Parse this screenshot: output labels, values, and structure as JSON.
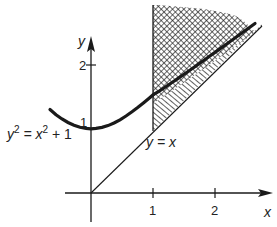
{
  "diagram": {
    "axes": {
      "x_label": "x",
      "y_label": "y",
      "x_ticks": [
        {
          "value": 1,
          "label": "1"
        },
        {
          "value": 2,
          "label": "2"
        }
      ],
      "y_ticks": [
        {
          "value": 1,
          "label": "1"
        },
        {
          "value": 2,
          "label": "2"
        }
      ]
    },
    "curves": [
      {
        "name": "hyperbola",
        "equation": "y² = x² + 1",
        "label_base": "y",
        "label_mid": " = x",
        "label_end": " + 1",
        "sup": "2"
      },
      {
        "name": "line",
        "equation": "y = x",
        "label": "y = x"
      }
    ],
    "regions": [
      {
        "name": "region-above-hyperbola",
        "bounds": "x ≥ 1, y ≥ √(x²+1)",
        "pattern": "cross-hatch"
      },
      {
        "name": "region-between",
        "bounds": "x ≥ 1, x ≤ y ≤ √(x²+1)",
        "pattern": "diagonal-hatch"
      }
    ],
    "colors": {
      "ink": "#1a1a1a",
      "background": "#ffffff"
    }
  }
}
